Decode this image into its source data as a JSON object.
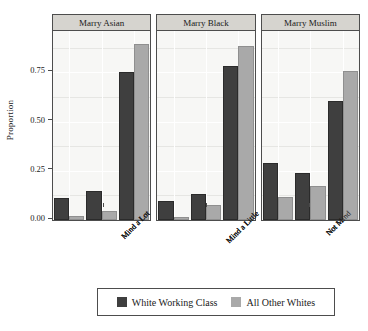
{
  "chart_data": {
    "type": "bar",
    "title": "",
    "subtitle": "",
    "xlabel": "",
    "ylabel": "Proportion",
    "ylim": [
      0.0,
      0.96
    ],
    "yticks": [
      0.0,
      0.25,
      0.5,
      0.75
    ],
    "ytick_labels": [
      "0.00",
      "0.25",
      "0.50",
      "0.75"
    ],
    "grid": true,
    "grid_orientation": "both",
    "legend_position": "bottom",
    "facet_titles": [
      "Marry Asian",
      "Marry Black",
      "Marry Muslim"
    ],
    "categories": [
      "Mind a Lot",
      "Mind a Little",
      "Not Mind"
    ],
    "series_names": [
      "White Working Class",
      "All Other Whites"
    ],
    "series_colors": [
      "#3f3f3f",
      "#a9a9a9"
    ],
    "panels": [
      {
        "title": "Marry Asian",
        "series": [
          {
            "name": "White Working Class",
            "color": "#3f3f3f",
            "values": [
              0.11,
              0.145,
              0.75
            ]
          },
          {
            "name": "All Other Whites",
            "color": "#a9a9a9",
            "values": [
              0.02,
              0.045,
              0.895
            ]
          }
        ]
      },
      {
        "title": "Marry Black",
        "series": [
          {
            "name": "White Working Class",
            "color": "#3f3f3f",
            "values": [
              0.095,
              0.13,
              0.78
            ]
          },
          {
            "name": "All Other Whites",
            "color": "#a9a9a9",
            "values": [
              0.015,
              0.075,
              0.885
            ]
          }
        ]
      },
      {
        "title": "Marry Muslim",
        "series": [
          {
            "name": "White Working Class",
            "color": "#3f3f3f",
            "values": [
              0.29,
              0.24,
              0.605
            ]
          },
          {
            "name": "All Other Whites",
            "color": "#a9a9a9",
            "values": [
              0.115,
              0.175,
              0.755
            ]
          }
        ]
      }
    ]
  },
  "axis": {
    "y_label": "Proportion",
    "y_tick_labels": [
      "0.75",
      "0.50",
      "0.25",
      "0.00"
    ]
  },
  "legend": {
    "items": [
      {
        "label": "White Working Class",
        "color": "#3f3f3f"
      },
      {
        "label": "All Other Whites",
        "color": "#a9a9a9"
      }
    ]
  }
}
